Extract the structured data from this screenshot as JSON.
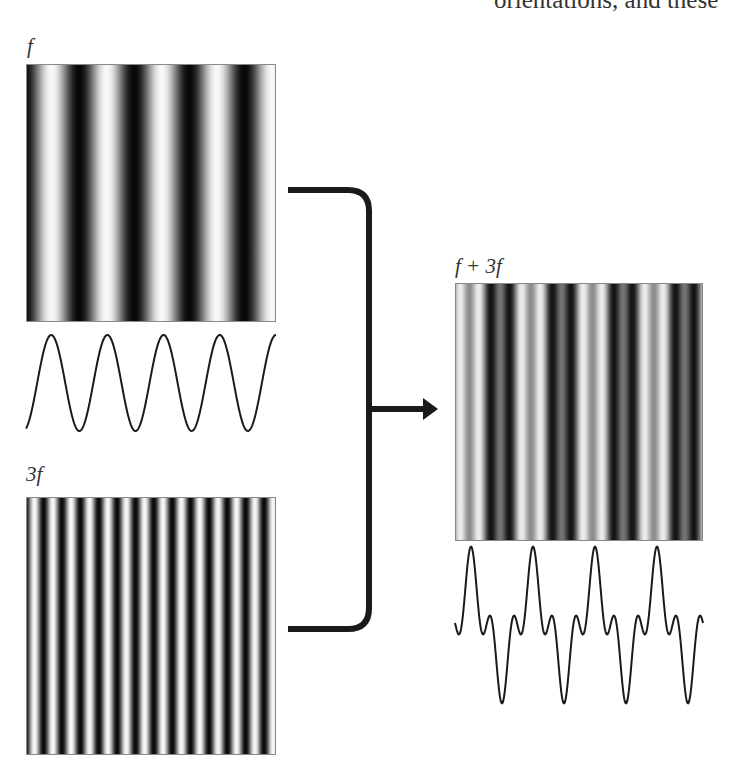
{
  "caption_fragment": "orientations, and these",
  "panels": {
    "f": {
      "label": "f",
      "cycles": 4.5,
      "phase": "dark-start"
    },
    "three_f": {
      "label": "3f",
      "cycles": 13.5
    },
    "sum": {
      "label": "f + 3f"
    }
  },
  "waveforms": {
    "f": {
      "periods": 4.5,
      "peaks": 4
    },
    "sum": {
      "components": [
        "f",
        "3f"
      ],
      "period_count": 4
    }
  },
  "arrow": {
    "direction": "right",
    "meaning": "combine"
  },
  "colors": {
    "ink": "#1a1a1a",
    "background": "#ffffff",
    "border": "#8a8a8a"
  }
}
